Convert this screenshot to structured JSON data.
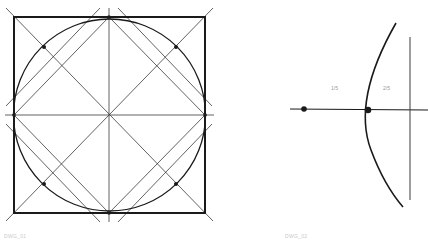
{
  "figures": [
    {
      "name": "square-circle-construction",
      "caption": "DWG_01"
    },
    {
      "name": "arc-division-construction",
      "caption": "DWG_02",
      "labels": [
        "1/5",
        "2/5"
      ]
    }
  ],
  "colors": {
    "ink": "#1a1a1a",
    "thin_line": "#3a3a3a",
    "caption": "#c8c8c8",
    "label": "#9a9a9a"
  }
}
